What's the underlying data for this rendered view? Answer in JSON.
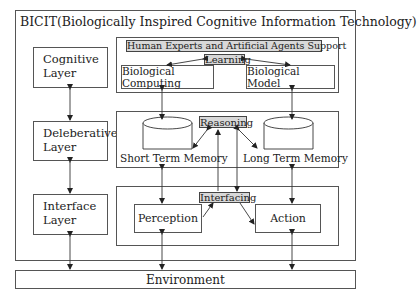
{
  "title": "BICIT(Biologically Inspired Cognitive Information Technology)",
  "layers": [
    {
      "label": "Cognitive\nLayer"
    },
    {
      "label": "Deleberative\nLayer"
    },
    {
      "label": "Interface\nLayer"
    }
  ],
  "cognitive_module": {
    "support_label": "Human Experts and Artificial Agents Support",
    "learning_label": "Learning",
    "left_box": "Biological Computing",
    "right_box": "Biological Model"
  },
  "deliberative_module": {
    "reasoning_label": "Reasoning",
    "left_memory": "Short Term Memory",
    "right_memory": "Long Term Memory"
  },
  "interface_module": {
    "interfacing_label": "Interfacing",
    "left_box": "Perception",
    "right_box": "Action"
  },
  "environment": "Environment",
  "colors": {
    "line": "#444444",
    "label_fill": "#d8d8d8",
    "background": "#ffffff"
  }
}
